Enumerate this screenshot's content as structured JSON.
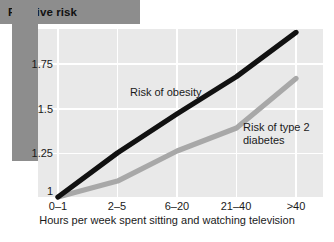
{
  "title": {
    "text": "Relative risk",
    "banner_color": "#8d8d8d"
  },
  "axis": {
    "x_title": "Hours per week spent sitting and watching television",
    "y_ticks": [
      "1.75",
      "1.5",
      "1.25",
      "1"
    ],
    "x_ticks": [
      "0–1",
      "2–5",
      "6–20",
      "21–40",
      ">40"
    ]
  },
  "series_labels": {
    "obesity": "Risk of obesity",
    "diabetes_line1": "Risk of type 2",
    "diabetes_line2": "diabetes"
  },
  "chart_data": {
    "type": "line",
    "title": "Relative risk",
    "xlabel": "Hours per week spent sitting and watching television",
    "ylabel": "Relative risk",
    "categories": [
      "0–1",
      "2–5",
      "6–20",
      "21–40",
      ">40"
    ],
    "ylim": [
      1.0,
      2.0
    ],
    "yticks": [
      1,
      1.25,
      1.5,
      1.75
    ],
    "grid": true,
    "legend": "inline-annotations",
    "series": [
      {
        "name": "Risk of obesity",
        "color": "#111111",
        "values": [
          1.0,
          1.25,
          1.47,
          1.68,
          1.93
        ]
      },
      {
        "name": "Risk of type 2 diabetes",
        "color": "#a8a8a8",
        "values": [
          1.0,
          1.09,
          1.26,
          1.39,
          1.67
        ]
      }
    ]
  },
  "geometry": {
    "plot_left": 38,
    "plot_right": 323,
    "plot_top": 29,
    "plot_bottom": 198,
    "x_positions": [
      58,
      117.5,
      177,
      236.5,
      296
    ],
    "y_baseline": 197,
    "y_per_unit": 177.0
  }
}
